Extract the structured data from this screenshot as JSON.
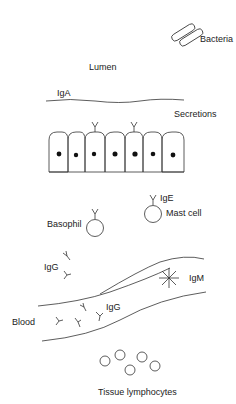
{
  "diagram": {
    "type": "immunoglobulin distribution schematic",
    "labels": {
      "bacteria": "Bacteria",
      "lumen": "Lumen",
      "iga": "IgA",
      "secretions": "Secretions",
      "ige": "IgE",
      "mast_cell": "Mast cell",
      "basophil": "Basophil",
      "igg_tissue": "IgG",
      "igm": "IgM",
      "igg_blood": "IgG",
      "blood": "Blood",
      "tissue_lymphocytes": "Tissue lymphocytes"
    },
    "epithelium": {
      "cell_count": 7,
      "igA_receptors": 2
    },
    "tissue_lymphocyte_count": 5,
    "colors": {
      "line": "#333333",
      "text": "#222222",
      "background": "#ffffff"
    }
  }
}
